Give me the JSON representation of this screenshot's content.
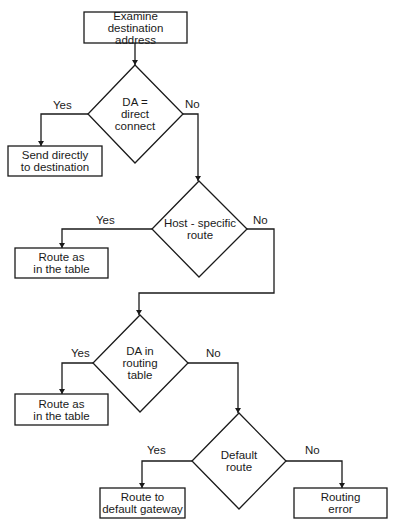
{
  "diagram": {
    "type": "flowchart",
    "nodes": {
      "start": {
        "kind": "process",
        "lines": [
          "Examine destination",
          "address"
        ]
      },
      "d1": {
        "kind": "decision",
        "lines": [
          "DA =",
          "direct",
          "connect"
        ]
      },
      "p1": {
        "kind": "process",
        "lines": [
          "Send directly",
          "to destination"
        ]
      },
      "d2": {
        "kind": "decision",
        "lines": [
          "Host - specific",
          "route"
        ]
      },
      "p2": {
        "kind": "process",
        "lines": [
          "Route as",
          "in the table"
        ]
      },
      "d3": {
        "kind": "decision",
        "lines": [
          "DA in",
          "routing",
          "table"
        ]
      },
      "p3": {
        "kind": "process",
        "lines": [
          "Route as",
          "in the table"
        ]
      },
      "d4": {
        "kind": "decision",
        "lines": [
          "Default",
          "route"
        ]
      },
      "p4": {
        "kind": "process",
        "lines": [
          "Route to",
          "default gateway"
        ]
      },
      "p5": {
        "kind": "process",
        "lines": [
          "Routing",
          "error"
        ]
      }
    },
    "edges": [
      {
        "from": "start",
        "to": "d1",
        "label": ""
      },
      {
        "from": "d1",
        "to": "p1",
        "label": "Yes"
      },
      {
        "from": "d1",
        "to": "d2",
        "label": "No"
      },
      {
        "from": "d2",
        "to": "p2",
        "label": "Yes"
      },
      {
        "from": "d2",
        "to": "d3",
        "label": "No"
      },
      {
        "from": "d3",
        "to": "p3",
        "label": "Yes"
      },
      {
        "from": "d3",
        "to": "d4",
        "label": "No"
      },
      {
        "from": "d4",
        "to": "p4",
        "label": "Yes"
      },
      {
        "from": "d4",
        "to": "p5",
        "label": "No"
      }
    ],
    "labels": {
      "yes": "Yes",
      "no": "No"
    },
    "colors": {
      "stroke": "#1a1a1a",
      "background": "#ffffff"
    }
  }
}
